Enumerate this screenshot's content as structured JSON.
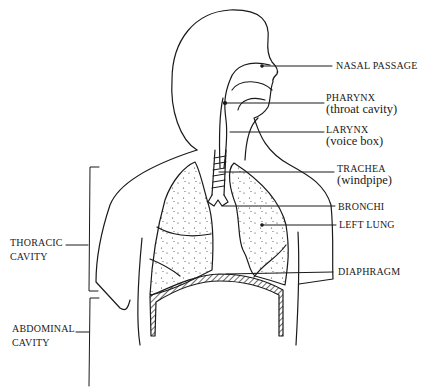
{
  "diagram": {
    "type": "anatomy-line-drawing",
    "labels_right": [
      {
        "id": "nasal-passage",
        "title": "NASAL PASSAGE",
        "subtitle": null
      },
      {
        "id": "pharynx",
        "title": "PHARYNX",
        "subtitle": "(throat cavity)"
      },
      {
        "id": "larynx",
        "title": "LARYNX",
        "subtitle": "(voice box)"
      },
      {
        "id": "trachea",
        "title": "TRACHEA",
        "subtitle": "(windpipe)"
      },
      {
        "id": "bronchi",
        "title": "BRONCHI",
        "subtitle": null
      },
      {
        "id": "left-lung",
        "title": "LEFT LUNG",
        "subtitle": null
      },
      {
        "id": "diaphragm",
        "title": "DIAPHRAGM",
        "subtitle": null
      }
    ],
    "labels_left": [
      {
        "id": "thoracic-cavity",
        "line1": "THORACIC",
        "line2": "CAVITY"
      },
      {
        "id": "abdominal-cavity",
        "line1": "ABDOMINAL",
        "line2": "CAVITY"
      }
    ],
    "colors": {
      "ink": "#1a1a1a",
      "background": "#ffffff"
    }
  }
}
